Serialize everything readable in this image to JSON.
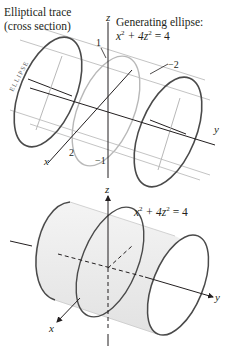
{
  "top_figure": {
    "caption_line1": "Elliptical trace",
    "caption_line2": "(cross section)",
    "generating_title": "Generating ellipse:",
    "generating_eq_x": "x",
    "generating_eq_mid": " + 4z",
    "generating_eq_end": " = 4",
    "sup": "2",
    "ellipse_word": "ELLIPSE",
    "axis_x": "x",
    "axis_y": "y",
    "axis_z": "z",
    "tick_z_pos": "1",
    "tick_z_neg": "−1",
    "tick_x_pos": "2",
    "tick_x_neg": "−2"
  },
  "bottom_figure": {
    "eq_x": "x",
    "eq_mid": " + 4z",
    "eq_end": " = 4",
    "sup": "2",
    "axis_x": "x",
    "axis_y": "y",
    "axis_z": "z"
  },
  "colors": {
    "dark_curve": "#4a4a4a",
    "light_curve": "#b8b8b8",
    "surface_fill": "#ececec",
    "axis": "#231f20"
  }
}
